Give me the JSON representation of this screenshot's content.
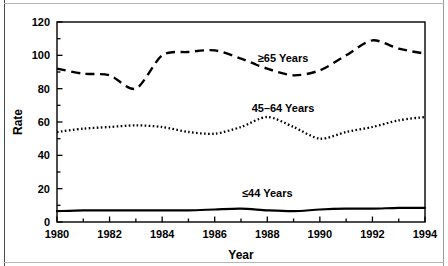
{
  "chart_data": {
    "type": "line",
    "title": "",
    "xlabel": "Year",
    "ylabel": "Rate",
    "xlim": [
      1980,
      1994
    ],
    "ylim": [
      0,
      120
    ],
    "grid": false,
    "legend_position": "inline-annotations",
    "x": [
      1980,
      1981,
      1982,
      1983,
      1984,
      1985,
      1986,
      1987,
      1988,
      1989,
      1990,
      1991,
      1992,
      1993,
      1994
    ],
    "xticks": [
      1980,
      1981,
      1982,
      1983,
      1984,
      1985,
      1986,
      1987,
      1988,
      1989,
      1990,
      1991,
      1992,
      1993,
      1994
    ],
    "xtick_labels": [
      "1980",
      "",
      "1982",
      "",
      "1984",
      "",
      "1986",
      "",
      "1988",
      "",
      "1990",
      "",
      "1992",
      "",
      "1994"
    ],
    "yticks": [
      0,
      10,
      20,
      30,
      40,
      50,
      60,
      70,
      80,
      90,
      100,
      110,
      120
    ],
    "ytick_labels": [
      "0",
      "",
      "20",
      "",
      "40",
      "",
      "60",
      "",
      "80",
      "",
      "100",
      "",
      "120"
    ],
    "series": [
      {
        "name": "≥65 Years",
        "style": "dashed",
        "values": [
          92,
          89,
          88,
          80,
          100,
          102,
          103,
          98,
          92,
          88,
          91,
          100,
          109,
          104,
          101
        ]
      },
      {
        "name": "45–64 Years",
        "style": "dotted",
        "values": [
          54,
          56,
          57,
          58,
          57,
          54,
          53,
          57,
          63,
          57,
          50,
          54,
          57,
          61,
          63
        ]
      },
      {
        "name": "≤44 Years",
        "style": "solid",
        "values": [
          6.5,
          7,
          7,
          7,
          7,
          7,
          7.5,
          8,
          7,
          6.5,
          7.5,
          8,
          8,
          8.5,
          8.5
        ]
      }
    ],
    "annotations": [
      {
        "text": "≥65 Years",
        "x": 1988.6,
        "y": 96,
        "name": "series-label-65-plus"
      },
      {
        "text": "45–64 Years",
        "x": 1988.6,
        "y": 66,
        "name": "series-label-45-64"
      },
      {
        "text": "≤44 Years",
        "x": 1988.0,
        "y": 15,
        "name": "series-label-44-under"
      }
    ],
    "colors": {
      "axis": "#000000",
      "series": "#000000",
      "background": "#ffffff"
    }
  }
}
